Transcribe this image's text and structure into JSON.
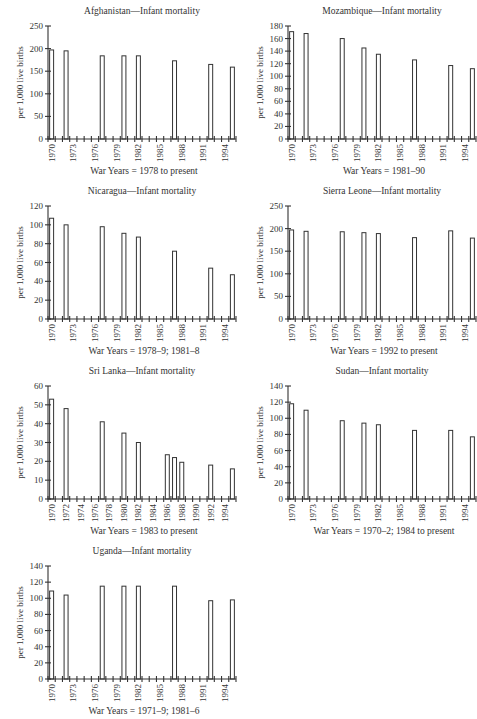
{
  "chart_data": [
    {
      "type": "bar",
      "title": "Afghanistan—Infant mortality",
      "ylabel": "per 1,000 live births",
      "xlabel": "War Years = 1978 to present",
      "ylim": [
        0,
        250
      ],
      "yticks": [
        0,
        50,
        100,
        150,
        200,
        250
      ],
      "x_tick_labels": [
        "1970",
        "1973",
        "1976",
        "1979",
        "1982",
        "1985",
        "1988",
        "1991",
        "1994"
      ],
      "x_range": [
        1970,
        1995
      ],
      "categories": [
        1970,
        1972,
        1977,
        1980,
        1982,
        1987,
        1992,
        1995
      ],
      "values": [
        197,
        195,
        184,
        184,
        184,
        173,
        165,
        159
      ],
      "grid": false
    },
    {
      "type": "bar",
      "title": "Mozambique—Infant mortality",
      "ylabel": "per 1,000 live births",
      "xlabel": "War Years = 1981–90",
      "ylim": [
        0,
        180
      ],
      "yticks": [
        0,
        20,
        40,
        60,
        80,
        100,
        120,
        140,
        160,
        180
      ],
      "x_tick_labels": [
        "1970",
        "1973",
        "1976",
        "1979",
        "1982",
        "1985",
        "1988",
        "1991",
        "1994"
      ],
      "x_range": [
        1970,
        1995
      ],
      "categories": [
        1970,
        1972,
        1977,
        1980,
        1982,
        1987,
        1992,
        1995
      ],
      "values": [
        171,
        168,
        160,
        145,
        135,
        126,
        117,
        112
      ],
      "grid": false
    },
    {
      "type": "bar",
      "title": "Nicaragua—Infant mortality",
      "ylabel": "per 1,000 live births",
      "xlabel": "War Years = 1978–9; 1981–8",
      "ylim": [
        0,
        120
      ],
      "yticks": [
        0,
        20,
        40,
        60,
        80,
        100,
        120
      ],
      "x_tick_labels": [
        "1970",
        "1973",
        "1976",
        "1979",
        "1982",
        "1985",
        "1988",
        "1991",
        "1994"
      ],
      "x_range": [
        1970,
        1995
      ],
      "categories": [
        1970,
        1972,
        1977,
        1980,
        1982,
        1987,
        1992,
        1995
      ],
      "values": [
        107,
        100,
        98,
        91,
        87,
        72,
        54,
        47
      ],
      "grid": false
    },
    {
      "type": "bar",
      "title": "Sierra Leone—Infant mortality",
      "ylabel": "per 1,000 live births",
      "xlabel": "War Years = 1992 to present",
      "ylim": [
        0,
        250
      ],
      "yticks": [
        0,
        50,
        100,
        150,
        200,
        250
      ],
      "x_tick_labels": [
        "1970",
        "1973",
        "1976",
        "1979",
        "1982",
        "1985",
        "1988",
        "1991",
        "1994"
      ],
      "x_range": [
        1970,
        1995
      ],
      "categories": [
        1970,
        1972,
        1977,
        1980,
        1982,
        1987,
        1992,
        1995
      ],
      "values": [
        197,
        194,
        193,
        191,
        189,
        180,
        195,
        179
      ],
      "grid": false
    },
    {
      "type": "bar",
      "title": "Sri Lanka—Infant mortality",
      "ylabel": "per 1,000 live births",
      "xlabel": "War Years = 1983 to present",
      "ylim": [
        0,
        60
      ],
      "yticks": [
        0,
        10,
        20,
        30,
        40,
        50,
        60
      ],
      "x_tick_labels": [
        "1970",
        "1972",
        "1974",
        "1976",
        "1978",
        "1980",
        "1982",
        "1984",
        "1986",
        "1988",
        "1990",
        "1992",
        "1994"
      ],
      "x_range": [
        1970,
        1995
      ],
      "categories": [
        1970,
        1972,
        1977,
        1980,
        1982,
        1986,
        1987,
        1988,
        1992,
        1995
      ],
      "values": [
        53,
        48,
        41,
        35,
        30,
        23.5,
        22,
        19.5,
        18,
        16
      ],
      "grid": false
    },
    {
      "type": "bar",
      "title": "Sudan—Infant mortality",
      "ylabel": "per 1,000 live births",
      "xlabel": "War Years = 1970–2; 1984 to present",
      "ylim": [
        0,
        140
      ],
      "yticks": [
        0,
        20,
        40,
        60,
        80,
        100,
        120,
        140
      ],
      "x_tick_labels": [
        "1970",
        "1973",
        "1976",
        "1979",
        "1982",
        "1985",
        "1988",
        "1991",
        "1994"
      ],
      "x_range": [
        1970,
        1995
      ],
      "categories": [
        1970,
        1972,
        1977,
        1980,
        1982,
        1987,
        1992,
        1995
      ],
      "values": [
        118,
        110,
        97,
        94,
        92,
        85,
        85,
        77
      ],
      "grid": false
    },
    {
      "type": "bar",
      "title": "Uganda—Infant mortality",
      "ylabel": "per 1,000 live births",
      "xlabel": "War Years = 1971–9; 1981–6",
      "ylim": [
        0,
        140
      ],
      "yticks": [
        0,
        20,
        40,
        60,
        80,
        100,
        120,
        140
      ],
      "x_tick_labels": [
        "1970",
        "1973",
        "1976",
        "1979",
        "1982",
        "1985",
        "1988",
        "1991",
        "1994"
      ],
      "x_range": [
        1970,
        1995
      ],
      "categories": [
        1970,
        1972,
        1977,
        1980,
        1982,
        1987,
        1992,
        1995
      ],
      "values": [
        109,
        104,
        115,
        115,
        115,
        115,
        97,
        98
      ],
      "grid": false
    }
  ]
}
